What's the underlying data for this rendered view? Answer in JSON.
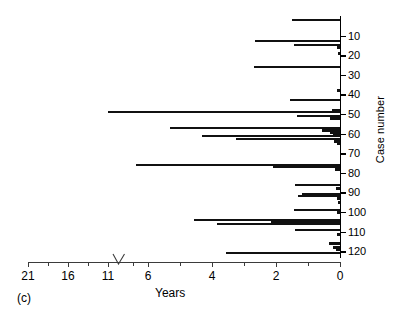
{
  "panel": {
    "label": "(c)"
  },
  "axes": {
    "x": {
      "title": "Years",
      "ticks_labeled": [
        "21",
        "16",
        "11",
        "6",
        "4",
        "2",
        "0"
      ],
      "reversed": true,
      "has_break": true,
      "break_between": [
        "11",
        "6"
      ]
    },
    "y": {
      "title": "Case number",
      "ticks_labeled": [
        "10",
        "20",
        "30",
        "40",
        "50",
        "60",
        "70",
        "80",
        "90",
        "100",
        "110",
        "120"
      ]
    }
  },
  "colors": {
    "bar": "#111111",
    "axis": "#3b3b3b",
    "y_axis": "#000000",
    "background": "#ffffff"
  },
  "chart_data": {
    "type": "bar",
    "orientation": "horizontal",
    "title": "",
    "xlabel": "Years",
    "ylabel": "Case number",
    "xlim": [
      21,
      0
    ],
    "ylim": [
      0,
      123
    ],
    "grid": false,
    "legend": null,
    "x_axis_reversed": true,
    "x_axis_break": {
      "from": 10.0,
      "to": 7.2
    },
    "note": "Each bar is one case; bar length = follow-up duration in years, anchored at 0 on the right.",
    "categories": [
      "2",
      "13",
      "15",
      "16",
      "19",
      "26",
      "38",
      "43",
      "48",
      "49",
      "51",
      "52",
      "57",
      "58",
      "59",
      "60",
      "61",
      "63",
      "64",
      "65",
      "76",
      "77",
      "78",
      "86",
      "88",
      "91",
      "92",
      "93",
      "95",
      "99",
      "100",
      "104",
      "105",
      "106",
      "109",
      "111",
      "116",
      "118",
      "119",
      "121"
    ],
    "values": [
      1.5,
      2.65,
      1.45,
      0.08,
      0.05,
      2.7,
      0.1,
      1.55,
      0.25,
      11.0,
      1.35,
      0.3,
      5.3,
      0.55,
      0.3,
      0.22,
      4.3,
      3.25,
      0.18,
      0.1,
      8.05,
      2.1,
      0.15,
      1.4,
      0.12,
      1.2,
      1.3,
      0.08,
      0.05,
      1.45,
      0.1,
      4.55,
      2.15,
      3.85,
      1.4,
      0.1,
      0.35,
      0.22,
      0.12,
      3.55
    ]
  },
  "bars": [
    {
      "case": 2,
      "years": 1.5
    },
    {
      "case": 13,
      "years": 2.65
    },
    {
      "case": 15,
      "years": 1.45
    },
    {
      "case": 16,
      "years": 0.08
    },
    {
      "case": 19,
      "years": 0.05
    },
    {
      "case": 26,
      "years": 2.7
    },
    {
      "case": 38,
      "years": 0.1
    },
    {
      "case": 43,
      "years": 1.55
    },
    {
      "case": 48,
      "years": 0.25
    },
    {
      "case": 49,
      "years": 11.0
    },
    {
      "case": 51,
      "years": 1.35
    },
    {
      "case": 52,
      "years": 0.3
    },
    {
      "case": 57,
      "years": 5.3
    },
    {
      "case": 58,
      "years": 0.55
    },
    {
      "case": 59,
      "years": 0.3
    },
    {
      "case": 60,
      "years": 0.22
    },
    {
      "case": 61,
      "years": 4.3
    },
    {
      "case": 63,
      "years": 3.25
    },
    {
      "case": 64,
      "years": 0.18
    },
    {
      "case": 65,
      "years": 0.1
    },
    {
      "case": 76,
      "years": 8.05
    },
    {
      "case": 77,
      "years": 2.1
    },
    {
      "case": 78,
      "years": 0.15
    },
    {
      "case": 86,
      "years": 1.4
    },
    {
      "case": 88,
      "years": 0.12
    },
    {
      "case": 91,
      "years": 1.2
    },
    {
      "case": 92,
      "years": 1.3
    },
    {
      "case": 93,
      "years": 0.08
    },
    {
      "case": 95,
      "years": 0.05
    },
    {
      "case": 99,
      "years": 1.45
    },
    {
      "case": 100,
      "years": 0.1
    },
    {
      "case": 104,
      "years": 4.55
    },
    {
      "case": 105,
      "years": 2.15
    },
    {
      "case": 106,
      "years": 3.85
    },
    {
      "case": 109,
      "years": 1.4
    },
    {
      "case": 111,
      "years": 0.1
    },
    {
      "case": 116,
      "years": 0.35
    },
    {
      "case": 118,
      "years": 0.22
    },
    {
      "case": 119,
      "years": 0.12
    },
    {
      "case": 121,
      "years": 3.55
    }
  ]
}
